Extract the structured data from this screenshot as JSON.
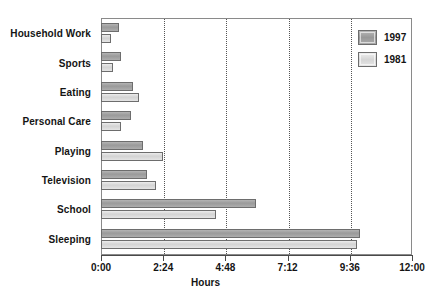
{
  "chart_data": {
    "type": "bar",
    "orientation": "horizontal",
    "title": "",
    "xlabel": "Hours",
    "ylabel": "",
    "xlim": [
      0,
      12
    ],
    "xticks": [
      0,
      2.4,
      4.8,
      7.2,
      9.6,
      12
    ],
    "xtick_labels": [
      "0:00",
      "2:24",
      "4:48",
      "7:12",
      "9:36",
      "12:00"
    ],
    "grid": true,
    "grid_axis": "x",
    "legend_position": "top-right",
    "categories": [
      "Household Work",
      "Sports",
      "Eating",
      "Personal Care",
      "Playing",
      "Television",
      "School",
      "Sleeping"
    ],
    "series": [
      {
        "name": "1997",
        "color": "#9a9a9a",
        "values": [
          0.7,
          0.77,
          1.23,
          1.15,
          1.62,
          1.77,
          5.98,
          10.0
        ],
        "value_labels": [
          "0:42",
          "0:46",
          "1:14",
          "1:09",
          "1:37",
          "1:46",
          "5:59",
          "10:00"
        ]
      },
      {
        "name": "1981",
        "color": "#d3d3d3",
        "values": [
          0.39,
          0.46,
          1.47,
          0.77,
          2.39,
          2.12,
          4.43,
          9.88
        ],
        "value_labels": [
          "0:23",
          "0:28",
          "1:28",
          "0:46",
          "2:23",
          "2:07",
          "4:26",
          "9:53"
        ]
      }
    ]
  },
  "legend": {
    "items": [
      {
        "label": "1997"
      },
      {
        "label": "1981"
      }
    ]
  },
  "axis": {
    "x_title": "Hours"
  }
}
